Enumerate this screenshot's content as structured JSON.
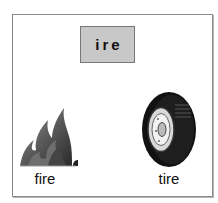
{
  "card": {
    "word_family": "ire",
    "items": [
      {
        "label": "fire",
        "icon": "fire-icon"
      },
      {
        "label": "tire",
        "icon": "tire-icon"
      }
    ]
  },
  "colors": {
    "box_fill": "#c8c8c8",
    "frame_border": "#8a8a8a"
  }
}
